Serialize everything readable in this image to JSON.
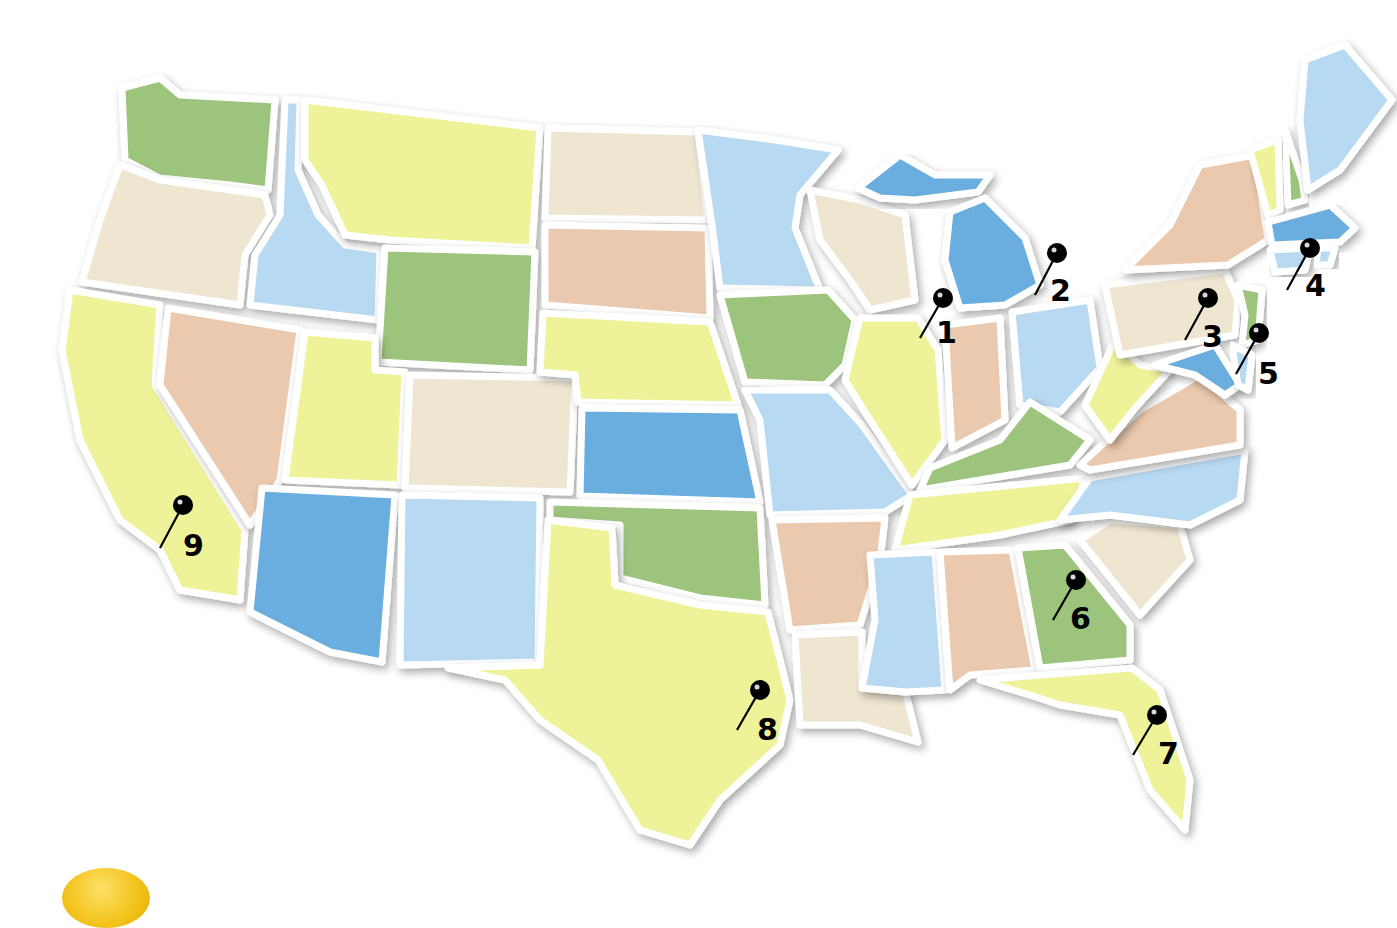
{
  "map": {
    "title": "United States",
    "colors": {
      "green": "#9cc47c",
      "yellow": "#eef39a",
      "beige": "#efe6d2",
      "peach": "#ebc9ae",
      "lightblue": "#b8d9f2",
      "blue": "#6aaee0"
    },
    "states": [
      {
        "name": "Washington",
        "color": "green",
        "points": "122,88 160,78 180,95 275,100 268,190 230,185 160,178 125,160"
      },
      {
        "name": "Oregon",
        "color": "beige",
        "points": "120,165 160,180 265,195 270,215 245,255 240,305 82,282 100,220"
      },
      {
        "name": "California",
        "color": "yellow",
        "points": "70,290 160,305 155,385 245,530 240,600 180,590 160,550 120,520 80,440 62,350"
      },
      {
        "name": "Nevada",
        "color": "peach",
        "points": "168,308 300,330 280,480 250,525 160,385"
      },
      {
        "name": "Idaho",
        "color": "lightblue",
        "points": "285,100 300,100 298,170 318,215 345,245 380,250 378,320 250,305 255,255 280,215"
      },
      {
        "name": "Montana",
        "color": "yellow",
        "points": "305,100 540,128 532,248 390,240 345,235 322,185 305,160"
      },
      {
        "name": "Wyoming",
        "color": "green",
        "points": "385,248 535,252 530,370 378,362"
      },
      {
        "name": "Utah",
        "color": "yellow",
        "points": "305,332 375,338 375,370 405,372 400,485 285,480"
      },
      {
        "name": "Colorado",
        "color": "beige",
        "points": "410,375 575,378 570,492 405,488"
      },
      {
        "name": "Arizona",
        "color": "blue",
        "points": "262,488 395,495 382,662 330,652 250,612 255,560"
      },
      {
        "name": "New Mexico",
        "color": "lightblue",
        "points": "402,495 540,498 538,662 400,665"
      },
      {
        "name": "North Dakota",
        "color": "beige",
        "points": "548,128 698,132 708,220 545,218"
      },
      {
        "name": "South Dakota",
        "color": "peach",
        "points": "545,225 708,228 710,318 545,305"
      },
      {
        "name": "Nebraska",
        "color": "yellow",
        "points": "543,313 710,322 738,405 578,402 575,375 540,372"
      },
      {
        "name": "Kansas",
        "color": "blue",
        "points": "582,408 740,410 760,502 580,496"
      },
      {
        "name": "Oklahoma",
        "color": "green",
        "points": "550,502 760,508 765,605 700,598 620,578 620,525 550,520"
      },
      {
        "name": "Texas",
        "color": "yellow",
        "points": "548,520 612,528 615,585 700,605 768,612 790,700 780,745 720,800 690,845 640,830 598,760 540,720 505,680 448,668 540,665"
      },
      {
        "name": "Minnesota",
        "color": "lightblue",
        "points": "698,130 775,140 838,150 800,195 795,228 820,290 720,288 712,225"
      },
      {
        "name": "Iowa",
        "color": "green",
        "points": "720,295 828,290 855,320 845,365 825,385 745,382"
      },
      {
        "name": "Missouri",
        "color": "lightblue",
        "points": "745,390 830,390 862,425 912,495 885,512 770,515 760,420"
      },
      {
        "name": "Arkansas",
        "color": "peach",
        "points": "772,520 885,518 880,560 860,625 790,630"
      },
      {
        "name": "Louisiana",
        "color": "beige",
        "points": "795,635 862,632 862,688 905,690 918,742 860,725 800,725"
      },
      {
        "name": "Wisconsin",
        "color": "beige",
        "points": "810,190 860,200 905,215 915,300 870,310 850,280 820,240"
      },
      {
        "name": "Illinois",
        "color": "yellow",
        "points": "860,318 918,318 938,350 945,440 912,485 870,420 845,380"
      },
      {
        "name": "Michigan UP",
        "color": "blue",
        "points": "858,188 900,155 935,175 990,175 978,192 915,200 880,198"
      },
      {
        "name": "Michigan",
        "color": "blue",
        "points": "950,212 985,198 1025,238 1040,285 1005,305 960,308 945,260"
      },
      {
        "name": "Indiana",
        "color": "peach",
        "points": "945,325 1000,318 1005,420 952,448"
      },
      {
        "name": "Ohio",
        "color": "lightblue",
        "points": "1012,312 1090,300 1100,368 1060,412 1020,405"
      },
      {
        "name": "Kentucky",
        "color": "green",
        "points": "930,468 1000,440 1030,402 1090,440 1070,465 920,490"
      },
      {
        "name": "Tennessee",
        "color": "yellow",
        "points": "910,495 1085,478 1070,520 1000,535 895,550"
      },
      {
        "name": "Mississippi",
        "color": "lightblue",
        "points": "870,555 935,552 945,690 905,692 862,688 875,620"
      },
      {
        "name": "Alabama",
        "color": "peach",
        "points": "940,552 1012,550 1035,670 970,675 950,690"
      },
      {
        "name": "Georgia",
        "color": "green",
        "points": "1018,548 1065,545 1130,625 1130,660 1040,668"
      },
      {
        "name": "Florida",
        "color": "yellow",
        "points": "980,680 1040,675 1132,668 1160,690 1190,780 1185,830 1150,790 1120,715 1060,705 1030,695"
      },
      {
        "name": "South Carolina",
        "color": "beige",
        "points": "1080,540 1110,520 1180,525 1190,560 1140,615"
      },
      {
        "name": "North Carolina",
        "color": "lightblue",
        "points": "1060,520 1090,478 1245,450 1240,500 1190,525 1110,515"
      },
      {
        "name": "Virginia",
        "color": "peach",
        "points": "1080,465 1140,410 1200,375 1240,410 1240,445 1090,470"
      },
      {
        "name": "West Virginia",
        "color": "yellow",
        "points": "1085,405 1115,340 1140,365 1170,370 1135,408 1110,440"
      },
      {
        "name": "Pennsylvania",
        "color": "beige",
        "points": "1105,285 1225,270 1238,300 1235,335 1120,355"
      },
      {
        "name": "New York",
        "color": "peach",
        "points": "1125,270 1170,225 1200,165 1255,155 1268,240 1228,265"
      },
      {
        "name": "New Jersey",
        "color": "green",
        "points": "1238,285 1262,290 1258,340 1242,345 1245,315"
      },
      {
        "name": "Maryland",
        "color": "blue",
        "points": "1155,365 1215,345 1240,385 1225,395 1195,375"
      },
      {
        "name": "Delaware",
        "color": "lightblue",
        "points": "1232,345 1252,355 1248,390 1238,385"
      },
      {
        "name": "Vermont",
        "color": "yellow",
        "points": "1250,150 1278,140 1280,210 1268,215"
      },
      {
        "name": "New Hampshire",
        "color": "green",
        "points": "1285,130 1302,180 1305,200 1288,205"
      },
      {
        "name": "Maine",
        "color": "lightblue",
        "points": "1305,60 1345,45 1392,100 1340,170 1308,190 1300,120"
      },
      {
        "name": "Massachusetts",
        "color": "blue",
        "points": "1268,222 1330,205 1355,228 1340,242 1272,245"
      },
      {
        "name": "Connecticut",
        "color": "lightblue",
        "points": "1270,250 1310,248 1305,270 1275,272"
      },
      {
        "name": "Rhode Island",
        "color": "lightblue",
        "points": "1318,248 1335,248 1330,265 1316,265"
      }
    ]
  },
  "pins": [
    {
      "label": "1",
      "head_x": 943,
      "head_y": 298,
      "tip_x": 920,
      "tip_y": 338,
      "label_x": 936,
      "label_y": 343
    },
    {
      "label": "2",
      "head_x": 1057,
      "head_y": 253,
      "tip_x": 1035,
      "tip_y": 295,
      "label_x": 1050,
      "label_y": 301
    },
    {
      "label": "3",
      "head_x": 1208,
      "head_y": 298,
      "tip_x": 1185,
      "tip_y": 340,
      "label_x": 1202,
      "label_y": 347
    },
    {
      "label": "4",
      "head_x": 1310,
      "head_y": 248,
      "tip_x": 1287,
      "tip_y": 290,
      "label_x": 1305,
      "label_y": 296
    },
    {
      "label": "5",
      "head_x": 1259,
      "head_y": 333,
      "tip_x": 1236,
      "tip_y": 374,
      "label_x": 1258,
      "label_y": 384
    },
    {
      "label": "6",
      "head_x": 1076,
      "head_y": 580,
      "tip_x": 1053,
      "tip_y": 620,
      "label_x": 1070,
      "label_y": 629
    },
    {
      "label": "7",
      "head_x": 1157,
      "head_y": 715,
      "tip_x": 1133,
      "tip_y": 755,
      "label_x": 1158,
      "label_y": 764
    },
    {
      "label": "8",
      "head_x": 760,
      "head_y": 690,
      "tip_x": 737,
      "tip_y": 730,
      "label_x": 757,
      "label_y": 740
    },
    {
      "label": "9",
      "head_x": 183,
      "head_y": 505,
      "tip_x": 160,
      "tip_y": 548,
      "label_x": 183,
      "label_y": 556
    }
  ],
  "decoration": {
    "lemon_color": "#f2c21a"
  }
}
